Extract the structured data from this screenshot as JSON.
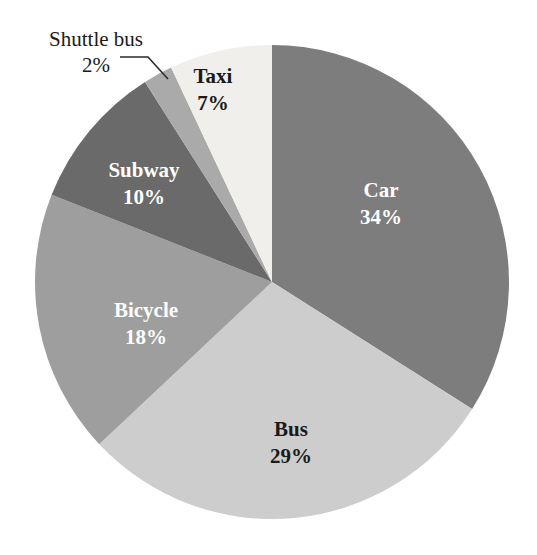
{
  "chart_data": {
    "type": "pie",
    "title": "",
    "subtitle": "",
    "xlabel": "",
    "ylabel": "",
    "legend_position": "none",
    "grid": false,
    "unit": "%",
    "start_angle_deg": 0,
    "direction": "clockwise",
    "categories": [
      "Car",
      "Bus",
      "Bicycle",
      "Subway",
      "Shuttle bus",
      "Taxi"
    ],
    "values": [
      34,
      29,
      18,
      10,
      2,
      7
    ],
    "slices": [
      {
        "name": "car-slice",
        "label": "Car",
        "percent_text": "34%",
        "value": 34,
        "color": "#7d7d7d",
        "label_color": "#ffffff",
        "label_placement": "inside",
        "label_x": 381,
        "label_y": 192,
        "start_deg": 0,
        "end_deg": 122.4
      },
      {
        "name": "bus-slice",
        "label": "Bus",
        "percent_text": "29%",
        "value": 29,
        "color": "#cdcdcd",
        "label_color": "#1a1a1a",
        "label_placement": "inside",
        "label_x": 291,
        "label_y": 431,
        "start_deg": 122.4,
        "end_deg": 226.8
      },
      {
        "name": "bicycle-slice",
        "label": "Bicycle",
        "percent_text": "18%",
        "value": 18,
        "color": "#9e9e9e",
        "label_color": "#ffffff",
        "label_placement": "inside",
        "label_x": 146,
        "label_y": 312,
        "start_deg": 226.8,
        "end_deg": 291.6
      },
      {
        "name": "subway-slice",
        "label": "Subway",
        "percent_text": "10%",
        "value": 10,
        "color": "#6a6a6a",
        "label_color": "#ffffff",
        "label_placement": "inside",
        "label_x": 144,
        "label_y": 172,
        "start_deg": 291.6,
        "end_deg": 327.6
      },
      {
        "name": "shuttle-bus-slice",
        "label": "Shuttle bus",
        "percent_text": "2%",
        "value": 2,
        "color": "#aaaaaa",
        "label_color": "#1a1a1a",
        "label_placement": "outside",
        "label_x": 96,
        "label_y": 46,
        "pct_x": 96,
        "pct_y": 72,
        "start_deg": 327.6,
        "end_deg": 334.8
      },
      {
        "name": "taxi-slice",
        "label": "Taxi",
        "percent_text": "7%",
        "value": 7,
        "color": "#f0efec",
        "label_color": "#1a1a1a",
        "label_placement": "inside",
        "label_x": 213,
        "label_y": 78,
        "start_deg": 334.8,
        "end_deg": 360
      }
    ],
    "geometry": {
      "center_x": 272,
      "center_y": 282,
      "radius": 237
    },
    "callout": {
      "name": "shuttle-bus-leader-line",
      "points": "120,57 148,57 168,79"
    }
  }
}
